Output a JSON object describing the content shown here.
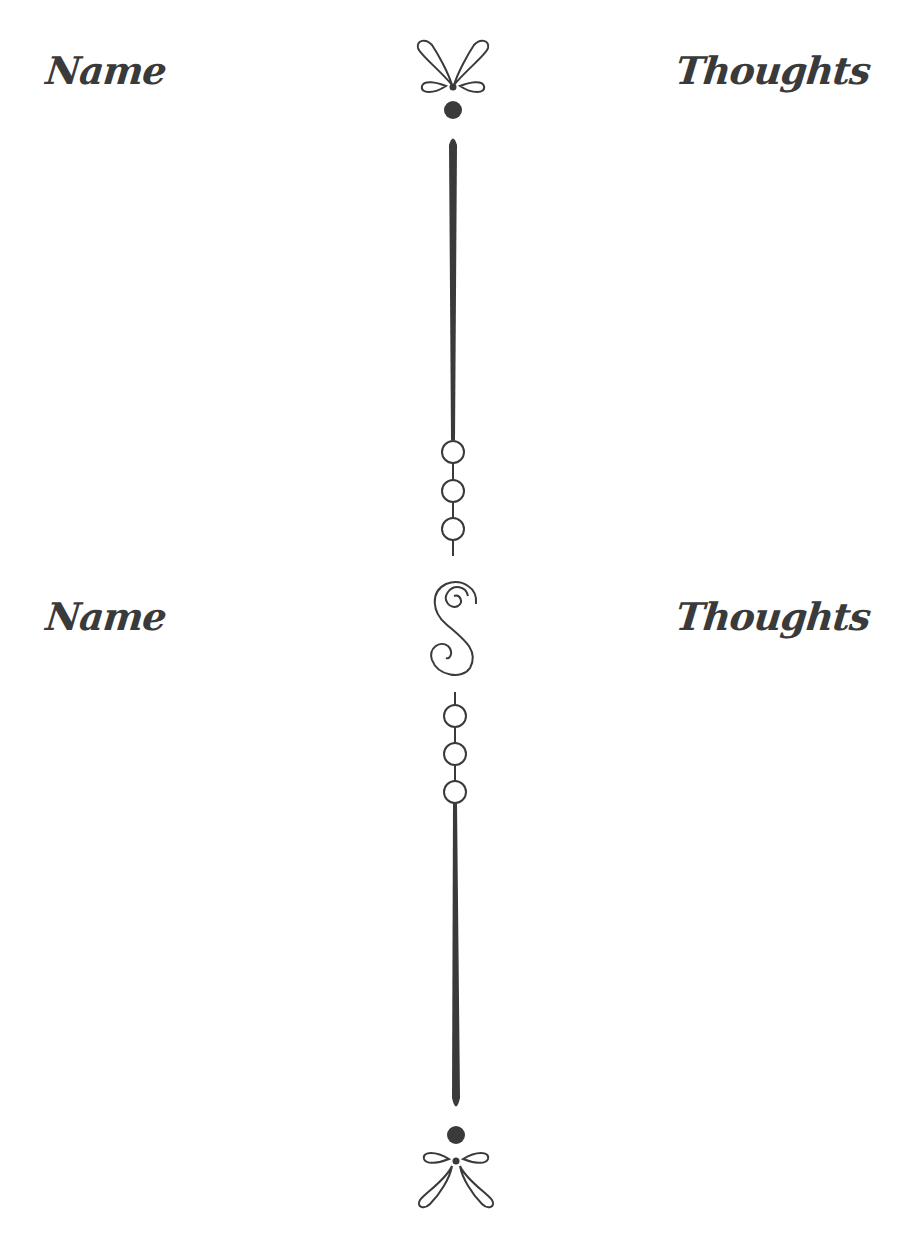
{
  "page": {
    "background": "#ffffff",
    "ink_color": "#3a3a3a"
  },
  "sections": [
    {
      "left_heading": "Name",
      "right_heading": "Thoughts"
    },
    {
      "left_heading": "Name",
      "right_heading": "Thoughts"
    }
  ],
  "icons": {
    "top": "flourish-bow-icon",
    "middle": "swirl-s-icon",
    "bottom": "flourish-bow-icon"
  }
}
